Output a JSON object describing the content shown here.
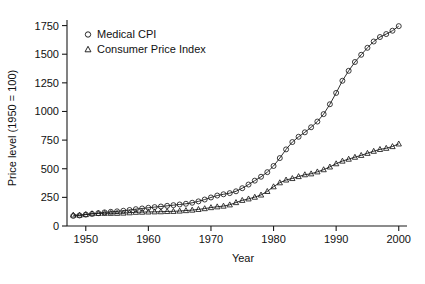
{
  "chart_data": {
    "type": "scatter",
    "title": "",
    "xlabel": "Year",
    "ylabel": "Price level (1950 = 100)",
    "xlim": [
      1947,
      2001
    ],
    "ylim": [
      0,
      1790
    ],
    "grid": false,
    "legend_position": "top-left",
    "xticks": [
      1950,
      1960,
      1970,
      1980,
      1990,
      2000
    ],
    "xtick_labels": [
      "1950",
      "1960",
      "1970",
      "1980",
      "1990",
      "2000"
    ],
    "yticks": [
      0,
      250,
      500,
      750,
      1000,
      1250,
      1500,
      1750
    ],
    "ytick_labels": [
      "0",
      "250",
      "500",
      "750",
      "1000",
      "1250",
      "1500",
      "1750"
    ],
    "x": [
      1948,
      1949,
      1950,
      1951,
      1952,
      1953,
      1954,
      1955,
      1956,
      1957,
      1958,
      1959,
      1960,
      1961,
      1962,
      1963,
      1964,
      1965,
      1966,
      1967,
      1968,
      1969,
      1970,
      1971,
      1972,
      1973,
      1974,
      1975,
      1976,
      1977,
      1978,
      1979,
      1980,
      1981,
      1982,
      1983,
      1984,
      1985,
      1986,
      1987,
      1988,
      1989,
      1990,
      1991,
      1992,
      1993,
      1994,
      1995,
      1996,
      1997,
      1998,
      1999,
      2000
    ],
    "series": [
      {
        "name": "Medical CPI",
        "marker": "circle",
        "color": "#1a1a1a",
        "values": [
          88,
          92,
          100,
          106,
          112,
          119,
          124,
          128,
          133,
          140,
          147,
          153,
          159,
          165,
          170,
          176,
          182,
          188,
          194,
          203,
          215,
          231,
          249,
          266,
          277,
          287,
          303,
          330,
          362,
          396,
          430,
          470,
          524,
          593,
          669,
          733,
          779,
          818,
          862,
          912,
          977,
          1063,
          1162,
          1268,
          1355,
          1432,
          1495,
          1556,
          1611,
          1650,
          1676,
          1705,
          1745
        ]
      },
      {
        "name": "Consumer Price Index",
        "marker": "triangle",
        "color": "#1a1a1a",
        "values": [
          96,
          95,
          100,
          108,
          110,
          111,
          111,
          111,
          113,
          116,
          120,
          121,
          123,
          124,
          125,
          127,
          128,
          131,
          135,
          139,
          145,
          152,
          161,
          168,
          174,
          185,
          205,
          224,
          237,
          252,
          271,
          302,
          343,
          378,
          402,
          415,
          432,
          448,
          456,
          473,
          492,
          516,
          544,
          567,
          584,
          601,
          617,
          635,
          653,
          669,
          679,
          694,
          717
        ]
      }
    ]
  },
  "legend": {
    "items": [
      {
        "label": "Medical CPI",
        "marker": "circle"
      },
      {
        "label": "Consumer Price Index",
        "marker": "triangle"
      }
    ]
  }
}
